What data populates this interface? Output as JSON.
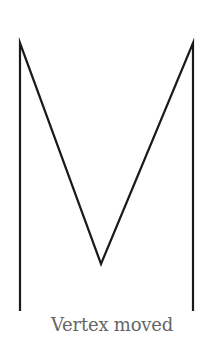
{
  "diagram": {
    "caption": "Vertex moved",
    "stroke_color": "#1a1a1a",
    "caption_color": "#666666",
    "polyline_points": [
      [
        20,
        311
      ],
      [
        20,
        43
      ],
      [
        101,
        264
      ],
      [
        193,
        43
      ],
      [
        193,
        311
      ]
    ],
    "vertices": {
      "left_bottom": [
        20,
        311
      ],
      "left_top": [
        20,
        43
      ],
      "moved_vertex": [
        101,
        264
      ],
      "right_top": [
        193,
        43
      ],
      "right_bottom": [
        193,
        311
      ]
    }
  }
}
